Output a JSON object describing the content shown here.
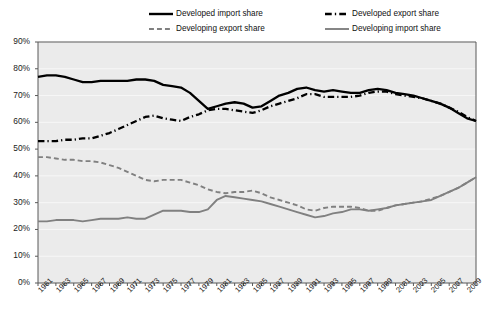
{
  "chart_data": {
    "type": "line",
    "title": "",
    "xlabel": "",
    "ylabel": "",
    "ylim": [
      0,
      90
    ],
    "ytick_labels": [
      "0%",
      "10%",
      "20%",
      "30%",
      "40%",
      "50%",
      "60%",
      "70%",
      "80%",
      "90%"
    ],
    "ytick_values": [
      0,
      10,
      20,
      30,
      40,
      50,
      60,
      70,
      80,
      90
    ],
    "grid": true,
    "legend_position": "top-center",
    "x": [
      1961,
      1962,
      1963,
      1964,
      1965,
      1966,
      1967,
      1968,
      1969,
      1970,
      1971,
      1972,
      1973,
      1974,
      1975,
      1976,
      1977,
      1978,
      1979,
      1980,
      1981,
      1982,
      1983,
      1984,
      1985,
      1986,
      1987,
      1988,
      1989,
      1990,
      1991,
      1992,
      1993,
      1994,
      1995,
      1996,
      1997,
      1998,
      1999,
      2000,
      2001,
      2002,
      2003,
      2004,
      2005,
      2006,
      2007,
      2008,
      2009,
      2010
    ],
    "xtick_labels": [
      "1961",
      "1963",
      "1965",
      "1967",
      "1969",
      "1971",
      "1973",
      "1975",
      "1977",
      "1979",
      "1981",
      "1983",
      "1985",
      "1987",
      "1989",
      "1991",
      "1993",
      "1995",
      "1997",
      "1999",
      "2001",
      "2003",
      "2005",
      "2007",
      "2009"
    ],
    "series": [
      {
        "name": "Developed import share",
        "style": "solid",
        "color": "#000000",
        "width": 2.3,
        "values": [
          77,
          77.5,
          77.5,
          77,
          76,
          75,
          75,
          75.5,
          75.5,
          75.5,
          75.5,
          76,
          76,
          75.5,
          74,
          73.5,
          73,
          71,
          68,
          65,
          66,
          67,
          67.5,
          67,
          65.5,
          66,
          68,
          70,
          71,
          72.5,
          73,
          72,
          71.5,
          72,
          71.5,
          71,
          71,
          72,
          72.5,
          72,
          71,
          70.5,
          70,
          69,
          68,
          67,
          65.5,
          63.5,
          61.5,
          60.5
        ]
      },
      {
        "name": "Developed export share",
        "style": "dashdot",
        "color": "#000000",
        "width": 2.3,
        "values": [
          53,
          53,
          53,
          53.5,
          53.5,
          54,
          54,
          55,
          56,
          57.5,
          59,
          60.5,
          62,
          62.5,
          61.5,
          61,
          60.5,
          62,
          63,
          64.5,
          65,
          65,
          64.5,
          64,
          63.5,
          64.5,
          66,
          67,
          68,
          69,
          70.5,
          70.5,
          69.5,
          69.5,
          69.5,
          69.5,
          70,
          71,
          71.5,
          71.5,
          70.5,
          70,
          69.5,
          69,
          68,
          67,
          65.5,
          64,
          62,
          60.5
        ]
      },
      {
        "name": "Developing export share",
        "style": "dashed",
        "color": "#808080",
        "width": 1.9,
        "values": [
          47,
          47,
          46.5,
          46,
          46,
          45.5,
          45.5,
          45,
          44,
          43,
          41.5,
          40,
          38.5,
          38,
          38.5,
          38.5,
          38.5,
          37.5,
          36.5,
          35,
          34,
          33.5,
          34,
          34,
          34.5,
          33.5,
          32,
          31,
          30,
          29,
          27.5,
          27,
          28,
          28.5,
          28.5,
          28.5,
          28,
          27,
          27,
          28,
          29,
          29.5,
          30,
          30.5,
          31.5,
          32.5,
          34,
          35.5,
          37.5,
          39.5
        ]
      },
      {
        "name": "Developing import share",
        "style": "solid",
        "color": "#808080",
        "width": 1.9,
        "values": [
          23,
          23,
          23.5,
          23.5,
          23.5,
          23,
          23.5,
          24,
          24,
          24,
          24.5,
          24,
          24,
          25.5,
          27,
          27,
          27,
          26.5,
          26.5,
          27.5,
          31,
          32.5,
          32,
          31.5,
          31,
          30.5,
          29.5,
          28.5,
          27.5,
          26.5,
          25.5,
          24.5,
          25,
          26,
          26.5,
          27.5,
          27.5,
          27,
          27.5,
          28,
          29,
          29.5,
          30,
          30.5,
          31,
          32.5,
          34,
          35.5,
          37.5,
          39.5
        ]
      }
    ]
  },
  "legend": {
    "items": [
      {
        "label": "Developed import share",
        "style": "solid",
        "color": "#000000"
      },
      {
        "label": "Developed export share",
        "style": "dashdot",
        "color": "#000000"
      },
      {
        "label": "Developing export share",
        "style": "dashed",
        "color": "#808080"
      },
      {
        "label": "Developing import share",
        "style": "solid",
        "color": "#808080"
      }
    ]
  },
  "colors": {
    "plot_background": "#ebebeb",
    "gridline": "#f7f7f7",
    "axis": "#595959",
    "text": "#1a1a1a"
  }
}
